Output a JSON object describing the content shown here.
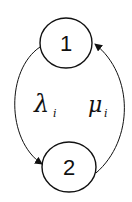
{
  "diagram": {
    "type": "state-transition",
    "nodes": [
      {
        "id": "1",
        "label": "1"
      },
      {
        "id": "2",
        "label": "2"
      }
    ],
    "edges": [
      {
        "from": "1",
        "to": "2",
        "label": "λ",
        "subscript": "i",
        "side": "left"
      },
      {
        "from": "2",
        "to": "1",
        "label": "μ",
        "subscript": "i",
        "side": "right"
      }
    ],
    "colors": {
      "stroke": "#111111",
      "background": "#ffffff"
    }
  }
}
